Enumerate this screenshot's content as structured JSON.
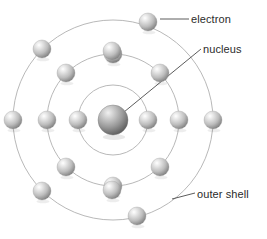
{
  "figure": {
    "kind": "atomic-structure-diagram",
    "background_color": "#ffffff"
  },
  "labels": {
    "electron": "electron",
    "nucleus": "nucleus",
    "outer_shell": "outer shell"
  },
  "colors": {
    "text": "#2b2b2b",
    "leader_line": "#4a4a4a",
    "shell_stroke": "#b0b0b0",
    "sphere_highlight": "#ffffff",
    "sphere_mid": "#c9c9c9",
    "sphere_dark": "#7d7d7d",
    "nucleus_highlight": "#e8e8e8",
    "nucleus_mid": "#a8a8a8",
    "nucleus_dark": "#5a5a5a"
  },
  "atom": {
    "center": {
      "x": 113,
      "y": 120
    },
    "nucleus_radius": 15,
    "shells": [
      {
        "name": "inner-shell",
        "radius": 35,
        "electron_count": 2
      },
      {
        "name": "middle-shell",
        "radius": 66,
        "electron_count": 8
      },
      {
        "name": "outer-shell",
        "radius": 100,
        "electron_count": 8
      }
    ],
    "electron_radius": 9,
    "electrons": [
      {
        "shell": 0,
        "x": 78,
        "y": 120
      },
      {
        "shell": 0,
        "x": 148,
        "y": 120
      },
      {
        "shell": 1,
        "x": 47,
        "y": 120
      },
      {
        "shell": 1,
        "x": 179,
        "y": 120
      },
      {
        "shell": 1,
        "x": 113,
        "y": 54
      },
      {
        "shell": 1,
        "x": 113,
        "y": 186
      },
      {
        "shell": 1,
        "x": 66,
        "y": 73
      },
      {
        "shell": 1,
        "x": 160,
        "y": 73
      },
      {
        "shell": 1,
        "x": 66,
        "y": 167
      },
      {
        "shell": 1,
        "x": 160,
        "y": 167
      },
      {
        "shell": 2,
        "x": 13,
        "y": 120
      },
      {
        "shell": 2,
        "x": 213,
        "y": 120
      },
      {
        "shell": 2,
        "x": 148,
        "y": 22
      },
      {
        "shell": 2,
        "x": 137,
        "y": 216
      },
      {
        "shell": 2,
        "x": 42,
        "y": 49
      },
      {
        "shell": 2,
        "x": 42,
        "y": 191
      },
      {
        "shell": 2,
        "x": 112,
        "y": 51
      },
      {
        "shell": 2,
        "x": 112,
        "y": 190
      }
    ],
    "leader_lines": [
      {
        "name": "electron-leader",
        "x1": 160,
        "y1": 19,
        "x2": 189,
        "y2": 19
      },
      {
        "name": "nucleus-leader",
        "x1": 124,
        "y1": 112,
        "x2": 201,
        "y2": 49
      },
      {
        "name": "outer-shell-leader",
        "x1": 172,
        "y1": 199,
        "x2": 195,
        "y2": 193
      }
    ]
  }
}
